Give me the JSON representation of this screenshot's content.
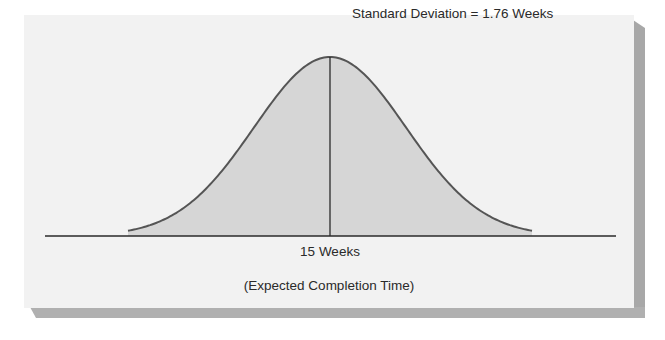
{
  "diagram": {
    "type": "normal-distribution",
    "annotation": "Standard Deviation = 1.76 Weeks",
    "mean_label": "15 Weeks",
    "axis_label": "(Expected Completion Time)",
    "colors": {
      "panel": "#f2f2f2",
      "fill": "#d6d6d6",
      "curve": "#555555",
      "line": "#2a2a2a",
      "shadow": "#a8a8a8"
    }
  },
  "chart_data": {
    "type": "area",
    "title": "",
    "distribution": "normal",
    "mean": 15,
    "mean_label": "15 Weeks",
    "standard_deviation": 1.76,
    "annotations": [
      "Standard Deviation = 1.76 Weeks"
    ],
    "xlabel": "(Expected Completion Time)",
    "ylabel": "",
    "grid": false,
    "legend": "none"
  }
}
